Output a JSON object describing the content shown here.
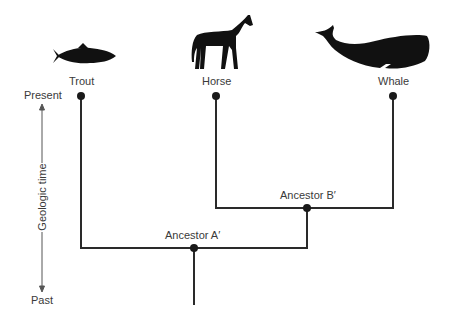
{
  "diagram": {
    "type": "cladogram",
    "taxa": [
      {
        "name": "Trout",
        "icon": "trout-icon"
      },
      {
        "name": "Horse",
        "icon": "horse-icon"
      },
      {
        "name": "Whale",
        "icon": "whale-icon"
      }
    ],
    "ancestors": [
      {
        "name": "Ancestor A′",
        "children": [
          "Trout",
          "Ancestor B′"
        ]
      },
      {
        "name": "Ancestor B′",
        "children": [
          "Horse",
          "Whale"
        ]
      }
    ],
    "time_axis": {
      "top": "Present",
      "bottom": "Past",
      "label": "Geologic time"
    },
    "line_color": "#222222"
  }
}
